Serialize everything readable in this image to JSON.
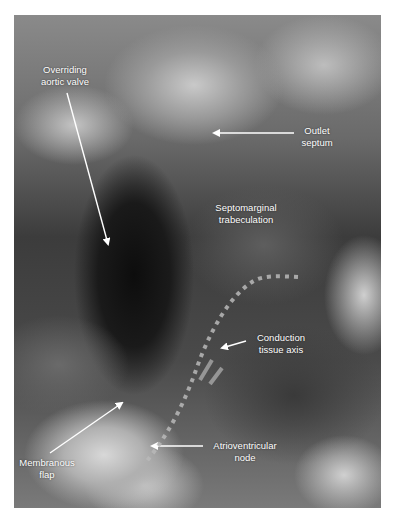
{
  "figure": {
    "type": "anatomical-photograph",
    "labels": {
      "overriding_aortic_valve": [
        "Overriding",
        "aortic valve"
      ],
      "outlet_septum": [
        "Outlet",
        "septum"
      ],
      "septomarginal_trabeculation": [
        "Septomarginal",
        "trabeculation"
      ],
      "conduction_tissue_axis": [
        "Conduction",
        "tissue axis"
      ],
      "membranous_flap": [
        "Membranous",
        "flap"
      ],
      "atrioventricular_node": [
        "Atrioventricular",
        "node"
      ]
    },
    "annotation_color": "#ffffff",
    "dotted_line_color": "#b8b8b8"
  }
}
